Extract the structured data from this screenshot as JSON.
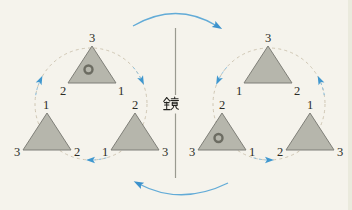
{
  "mirror": {
    "label": "鏡"
  },
  "left_group": {
    "rotation_direction": "clockwise",
    "triangles": {
      "top": {
        "apex": "3",
        "bottom_left": "2",
        "bottom_right": "1",
        "marker": "double-circle"
      },
      "bottom_left": {
        "apex": "1",
        "bottom_left": "3",
        "bottom_right": "2",
        "marker": "none"
      },
      "bottom_right": {
        "apex": "2",
        "bottom_left": "1",
        "bottom_right": "3",
        "marker": "none"
      }
    }
  },
  "right_group": {
    "rotation_direction": "counterclockwise",
    "triangles": {
      "top": {
        "apex": "3",
        "bottom_left": "1",
        "bottom_right": "2",
        "marker": "none"
      },
      "bottom_left": {
        "apex": "2",
        "bottom_left": "3",
        "bottom_right": "1",
        "marker": "double-circle"
      },
      "bottom_right": {
        "apex": "1",
        "bottom_left": "2",
        "bottom_right": "3",
        "marker": "none"
      }
    }
  },
  "colors": {
    "background": "#f5f3ec",
    "triangle_fill": "#b6b6ac",
    "triangle_stroke": "#7f7f78",
    "dashed_cycle": "#cfc6b3",
    "arrow_blue": "#3f97cf",
    "label_text": "#2b2b26",
    "mirror_line": "#9a9a90",
    "marker_ring": "#6c6c62"
  }
}
